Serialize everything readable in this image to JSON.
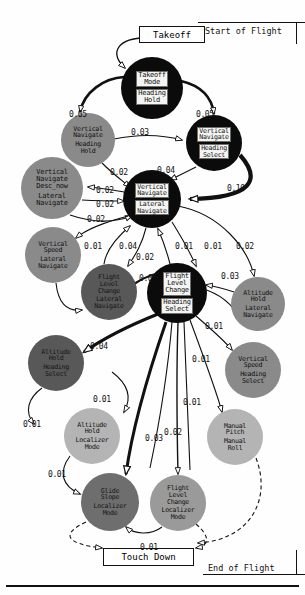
{
  "diagram": {
    "start_label": "Start of Flight",
    "end_label": "End of Flight",
    "terminals": [
      {
        "id": "takeoff",
        "label": "Takeoff"
      },
      {
        "id": "touchdown",
        "label": "Touch Down"
      }
    ],
    "nodes": [
      {
        "id": "n_takeoff_mode",
        "line1": "Takeoff",
        "line2": "Mode",
        "line3": "Heading",
        "line4": "Hold",
        "fill": "#0b0b0b",
        "text": "#111111",
        "plate": true,
        "cx": 152,
        "cy": 88,
        "r": 31
      },
      {
        "id": "n_vnav_hdg_hold",
        "line1": "Vertical",
        "line2": "Navigate",
        "line3": "Heading",
        "line4": "Hold",
        "fill": "#8a8a8a",
        "text": "#111111",
        "plate": false,
        "cx": 88,
        "cy": 140,
        "r": 27
      },
      {
        "id": "n_vnav_hdg_sel",
        "line1": "Vertical",
        "line2": "Navigate",
        "line3": "Heading",
        "line4": "Select",
        "fill": "#0b0b0b",
        "text": "#111111",
        "plate": true,
        "cx": 214,
        "cy": 143,
        "r": 28
      },
      {
        "id": "n_vnav_desc",
        "line1": "Vertical",
        "line2": "Navigate",
        "line2b": "Desc_now",
        "line3": "Lateral",
        "line4": "Navigate",
        "fill": "#8a8a8a",
        "text": "#111111",
        "plate": false,
        "cx": 52,
        "cy": 188,
        "r": 31
      },
      {
        "id": "n_vnav_lnav",
        "line1": "Vertical",
        "line2": "Navigate",
        "line3": "Lateral",
        "line4": "Navigate",
        "fill": "#0b0b0b",
        "text": "#111111",
        "plate": true,
        "cx": 152,
        "cy": 199,
        "r": 29
      },
      {
        "id": "n_vspd_lnav",
        "line1": "Vertical",
        "line2": "Speed",
        "line3": "Lateral",
        "line4": "Navigate",
        "fill": "#8a8a8a",
        "text": "#111111",
        "plate": false,
        "cx": 53,
        "cy": 255,
        "r": 28
      },
      {
        "id": "n_flch_lnav",
        "line1": "Flight",
        "line2": "Level",
        "line2b": "Change",
        "line3": "Lateral",
        "line4": "Navigate",
        "fill": "#585858",
        "text": "#151515",
        "plate": false,
        "cx": 109,
        "cy": 292,
        "r": 28
      },
      {
        "id": "n_flch_hdg_sel",
        "line1": "Flight",
        "line2": "Level",
        "line2b": "Change",
        "line3": "Heading",
        "line4": "Select",
        "fill": "#0b0b0b",
        "text": "#111111",
        "plate": true,
        "cx": 177,
        "cy": 293,
        "r": 30
      },
      {
        "id": "n_alt_lnav",
        "line1": "Altitude",
        "line2": "Hold",
        "line3": "Lateral",
        "line4": "Navigate",
        "fill": "#8a8a8a",
        "text": "#111111",
        "plate": false,
        "cx": 258,
        "cy": 304,
        "r": 27
      },
      {
        "id": "n_alt_hdg_sel",
        "line1": "Altitude",
        "line2": "Hold",
        "line3": "Heading",
        "line4": "Select",
        "fill": "#585858",
        "text": "#151515",
        "plate": false,
        "cx": 56,
        "cy": 363,
        "r": 28
      },
      {
        "id": "n_vspd_hdg_sel",
        "line1": "Vertical",
        "line2": "Speed",
        "line3": "Heading",
        "line4": "Select",
        "fill": "#8a8a8a",
        "text": "#111111",
        "plate": false,
        "cx": 253,
        "cy": 370,
        "r": 28
      },
      {
        "id": "n_alt_loc",
        "line1": "Altitude",
        "line2": "Hold",
        "line3": "Localizer",
        "line4": "Mode",
        "fill": "#b4b4b4",
        "text": "#111111",
        "plate": false,
        "cx": 92,
        "cy": 436,
        "r": 28
      },
      {
        "id": "n_manual",
        "line1": "Manual",
        "line2": "Pitch",
        "line3": "Manual",
        "line4": "Roll",
        "fill": "#b4b4b4",
        "text": "#111111",
        "plate": false,
        "cx": 235,
        "cy": 437,
        "r": 28
      },
      {
        "id": "n_glide_loc",
        "line1": "Glide",
        "line2": "Slope",
        "line3": "Localizer",
        "line4": "Mode",
        "fill": "#6e6e6e",
        "text": "#151515",
        "plate": false,
        "cx": 110,
        "cy": 502,
        "r": 29
      },
      {
        "id": "n_flch_loc",
        "line1": "Flight",
        "line2": "Level",
        "line2b": "Change",
        "line3": "Localizer",
        "line4": "Mode",
        "fill": "#9a9a9a",
        "text": "#111111",
        "plate": false,
        "cx": 178,
        "cy": 503,
        "r": 28
      }
    ],
    "edge_labels": [
      {
        "id": "e1",
        "value": "0.05",
        "x": 69,
        "y": 110
      },
      {
        "id": "e2",
        "value": "0.05",
        "x": 196,
        "y": 110
      },
      {
        "id": "e3",
        "value": "0.03",
        "x": 131,
        "y": 128
      },
      {
        "id": "e4",
        "value": "0.04",
        "x": 157,
        "y": 166
      },
      {
        "id": "e5",
        "value": "0.10",
        "x": 227,
        "y": 184
      },
      {
        "id": "e6",
        "value": "0.02",
        "x": 110,
        "y": 168
      },
      {
        "id": "e7",
        "value": "0.02",
        "x": 96,
        "y": 186
      },
      {
        "id": "e8",
        "value": "0.02",
        "x": 96,
        "y": 200
      },
      {
        "id": "e9",
        "value": "0.02",
        "x": 87,
        "y": 215
      },
      {
        "id": "e10",
        "value": "0.01",
        "x": 84,
        "y": 242
      },
      {
        "id": "e11",
        "value": "0.04",
        "x": 119,
        "y": 242
      },
      {
        "id": "e12",
        "value": "0.02",
        "x": 136,
        "y": 253
      },
      {
        "id": "e13",
        "value": "0.01",
        "x": 175,
        "y": 242
      },
      {
        "id": "e14",
        "value": "0.01",
        "x": 204,
        "y": 242
      },
      {
        "id": "e15",
        "value": "0.02",
        "x": 236,
        "y": 242
      },
      {
        "id": "e16",
        "value": "0.05",
        "x": 139,
        "y": 274
      },
      {
        "id": "e17",
        "value": "0.03",
        "x": 221,
        "y": 272
      },
      {
        "id": "e18",
        "value": "0.01",
        "x": 205,
        "y": 322
      },
      {
        "id": "e19",
        "value": "0.04",
        "x": 90,
        "y": 342
      },
      {
        "id": "e20",
        "value": "0.01",
        "x": 192,
        "y": 355
      },
      {
        "id": "e21",
        "value": "0.01",
        "x": 93,
        "y": 395
      },
      {
        "id": "e22",
        "value": "0.01",
        "x": 23,
        "y": 420
      },
      {
        "id": "e23",
        "value": "0.01",
        "x": 183,
        "y": 398
      },
      {
        "id": "e24",
        "value": "0.02",
        "x": 164,
        "y": 428
      },
      {
        "id": "e25",
        "value": "0.03",
        "x": 145,
        "y": 434
      },
      {
        "id": "e26",
        "value": "0.01",
        "x": 48,
        "y": 470
      },
      {
        "id": "e27",
        "value": "0.01",
        "x": 140,
        "y": 543
      }
    ]
  }
}
